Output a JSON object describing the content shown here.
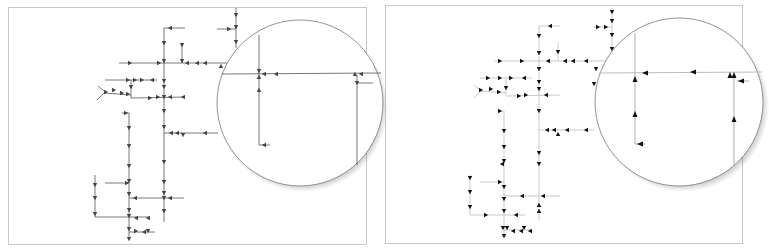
{
  "figure": {
    "panels": [
      {
        "id": "left",
        "description": "Network diagram with gray lines and dark gray direction arrows, with magnifier inset",
        "line_color": "#555555",
        "arrow_color": "#444444",
        "frame": {
          "x": 8,
          "y": 7,
          "w": 358,
          "h": 237
        }
      },
      {
        "id": "right",
        "description": "Same network diagram with light gray lines and black direction arrows, with magnifier inset",
        "line_color": "#bbbbbb",
        "arrow_color": "#111111",
        "frame": {
          "x": 385,
          "y": 5,
          "w": 356,
          "h": 237
        }
      }
    ],
    "magnifiers": [
      {
        "panel": "left",
        "cx": 300,
        "cy": 103,
        "r": 83
      },
      {
        "panel": "right",
        "cx": 680,
        "cy": 102,
        "r": 84
      }
    ]
  }
}
